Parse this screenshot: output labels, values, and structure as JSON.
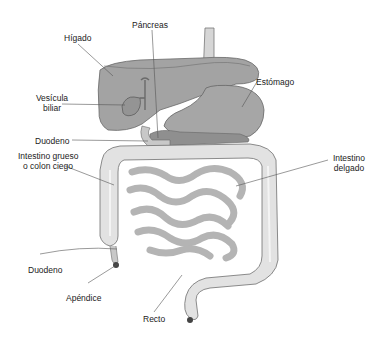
{
  "colors": {
    "organ_dark": "#9a9a9a",
    "organ_mid": "#b5b5b5",
    "organ_light": "#dcdcdc",
    "outline": "#6a6a6a",
    "leader": "#555555",
    "text": "#222222",
    "background": "#ffffff"
  },
  "labels": {
    "pancreas": "Páncreas",
    "higado": "Hígado",
    "estomago": "Estómago",
    "vesicula_line1": "Vesícula",
    "vesicula_line2": "biliar",
    "duodeno_upper": "Duodeno",
    "intestino_grueso_line1": "Intestino grueso",
    "intestino_grueso_line2": "o colon ciego",
    "intestino_delgado_line1": "Intestino",
    "intestino_delgado_line2": "delgado",
    "duodeno_lower": "Duodeno",
    "apendice": "Apéndice",
    "recto": "Recto"
  }
}
